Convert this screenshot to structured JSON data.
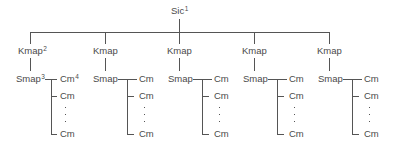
{
  "diagram": {
    "type": "hierarchy-tree",
    "root": {
      "label": "Sic",
      "footnote": "1"
    },
    "columns": [
      {
        "kmap": {
          "label": "Kmap",
          "footnote": "2"
        },
        "smap": {
          "label": "Smap",
          "footnote": "3"
        },
        "children": [
          {
            "label": "Cm",
            "footnote": "4"
          },
          {
            "label": "Cm",
            "footnote": ""
          },
          {
            "label": "⋮"
          },
          {
            "label": "Cm",
            "footnote": ""
          }
        ]
      },
      {
        "kmap": {
          "label": "Kmap",
          "footnote": ""
        },
        "smap": {
          "label": "Smap",
          "footnote": ""
        },
        "children": [
          {
            "label": "Cm",
            "footnote": ""
          },
          {
            "label": "Cm",
            "footnote": ""
          },
          {
            "label": "⋮"
          },
          {
            "label": "Cm",
            "footnote": ""
          }
        ]
      },
      {
        "kmap": {
          "label": "Kmap",
          "footnote": ""
        },
        "smap": {
          "label": "Smap",
          "footnote": ""
        },
        "children": [
          {
            "label": "Cm",
            "footnote": ""
          },
          {
            "label": "Cm",
            "footnote": ""
          },
          {
            "label": "⋮"
          },
          {
            "label": "Cm",
            "footnote": ""
          }
        ]
      },
      {
        "kmap": {
          "label": "Kmap",
          "footnote": ""
        },
        "smap": {
          "label": "Smap",
          "footnote": ""
        },
        "children": [
          {
            "label": "Cm",
            "footnote": ""
          },
          {
            "label": "Cm",
            "footnote": ""
          },
          {
            "label": "⋮"
          },
          {
            "label": "Cm",
            "footnote": ""
          }
        ]
      },
      {
        "kmap": {
          "label": "Kmap",
          "footnote": ""
        },
        "smap": {
          "label": "Smap",
          "footnote": ""
        },
        "children": [
          {
            "label": "Cm",
            "footnote": ""
          },
          {
            "label": "Cm",
            "footnote": ""
          },
          {
            "label": "⋮"
          },
          {
            "label": "Cm",
            "footnote": ""
          }
        ]
      }
    ]
  },
  "colors": {
    "line": "#555555",
    "text": "#4a4a4a",
    "background": "#ffffff"
  }
}
